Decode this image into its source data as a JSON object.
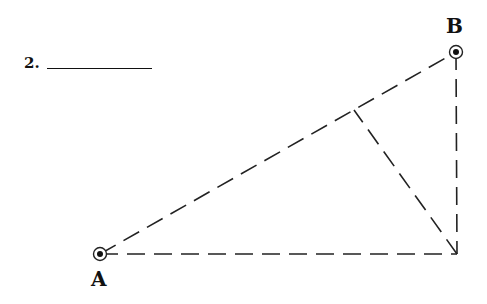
{
  "problem": {
    "number": "2."
  },
  "points": {
    "A": {
      "label": "A",
      "x": 100,
      "y": 254
    },
    "B": {
      "label": "B",
      "x": 456,
      "y": 52
    },
    "C": {
      "x": 457,
      "y": 254
    },
    "D": {
      "x": 354,
      "y": 110
    }
  },
  "segments": [
    {
      "name": "AB",
      "from": "A",
      "to": "B",
      "style": "dashed"
    },
    {
      "name": "AC",
      "from": "A",
      "to": "C",
      "style": "dashed"
    },
    {
      "name": "BC",
      "from": "B",
      "to": "C",
      "style": "dashed"
    },
    {
      "name": "CD",
      "from": "C",
      "to": "D",
      "style": "dashed"
    }
  ],
  "colors": {
    "stroke": "#222222",
    "background": "#ffffff"
  }
}
